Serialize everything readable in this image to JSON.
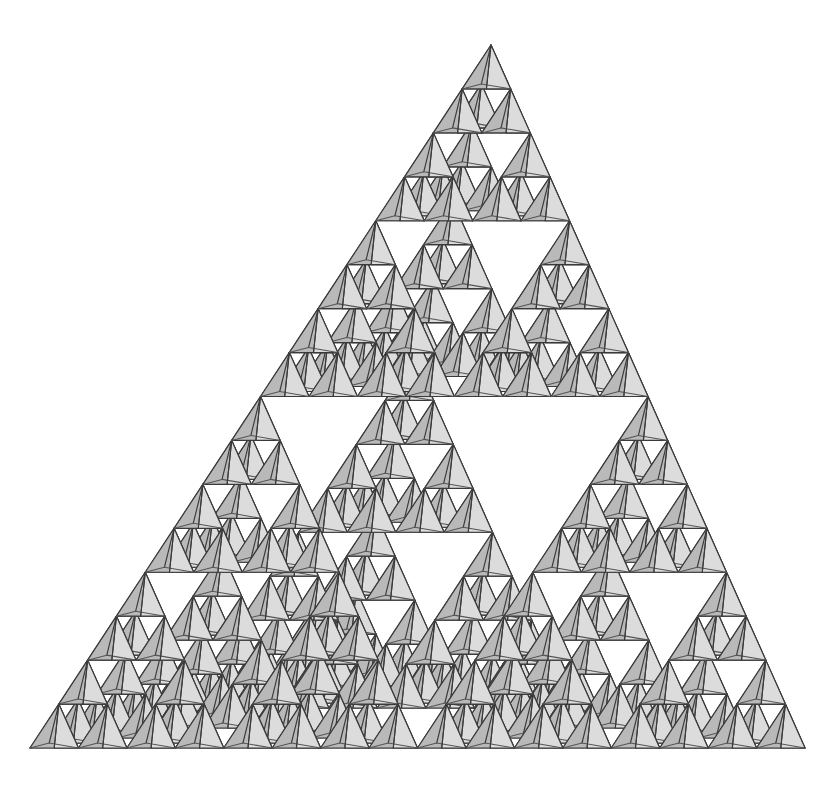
{
  "figure": {
    "type": "recursive-geometric-fractal",
    "recursion_depth": 4,
    "children_per_node": 4,
    "cell_count": 256,
    "background_color": "#ffffff"
  },
  "caption": {
    "top_text": "·  ·   ·  ·  ·"
  },
  "geometry": {
    "canvas_width": 824,
    "canvas_height": 786,
    "apex_x": 491,
    "apex_y": 45,
    "base_left_x": 30,
    "base_left_y": 748,
    "base_right_x": 805,
    "base_right_y": 748,
    "back_apex_x": 337,
    "back_apex_y": 668,
    "outline_label": "equilateral-triangle-silhouette"
  },
  "palette": {
    "stroke": "#3a3a3a",
    "stroke_light": "#555555",
    "face_left": "#b9b9b9",
    "face_right": "#dcdcdc",
    "face_back": "#f2f2f2",
    "face_bottom": "#6e6e6e",
    "face_bottom_alt": "#8a8a8a",
    "white": "#ffffff"
  },
  "chart_data": {
    "type": "diagram",
    "iterations": 4,
    "scale_factor": 0.5,
    "subcells_per_iteration": 4,
    "cells_by_level": [
      1,
      4,
      16,
      64,
      256
    ],
    "fractal_dimension": 2.0,
    "projection": "axonometric",
    "faces_per_cell": 4,
    "face_shading": [
      "left",
      "right",
      "bottom-front",
      "bottom-back"
    ]
  }
}
